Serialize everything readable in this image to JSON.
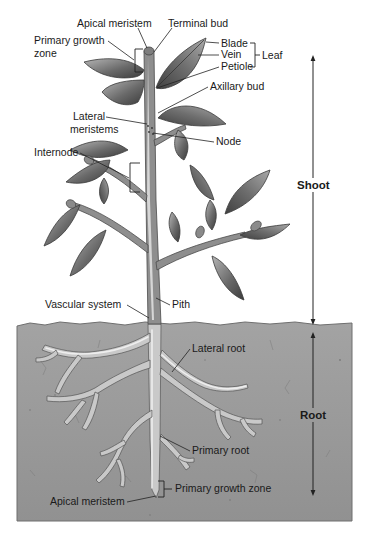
{
  "diagram": {
    "colors": {
      "background": "#ffffff",
      "soil": "#9a9a9a",
      "soil_edge": "#7a7a7a",
      "stem": "#8e8e8e",
      "leaf_dark": "#4f4f4f",
      "leaf_light": "#a8a8a8",
      "root": "#c9c9c9",
      "text": "#1a1a1a"
    },
    "labels": {
      "apical_meristem_top": "Apical meristem",
      "terminal_bud": "Terminal bud",
      "primary_growth_zone_top_line1": "Primary growth",
      "primary_growth_zone_top_line2": "zone",
      "blade": "Blade",
      "vein": "Vein",
      "petiole": "Petiole",
      "leaf": "Leaf",
      "axillary_bud": "Axillary bud",
      "lateral_meristems_line1": "Lateral",
      "lateral_meristems_line2": "meristems",
      "node": "Node",
      "internode": "Internode",
      "shoot": "Shoot",
      "vascular_system": "Vascular system",
      "pith": "Pith",
      "lateral_root": "Lateral root",
      "root": "Root",
      "primary_root": "Primary root",
      "primary_growth_zone_bottom": "Primary growth zone",
      "apical_meristem_bottom": "Apical meristem"
    },
    "regions": [
      {
        "name": "Shoot",
        "extent": "above soil line"
      },
      {
        "name": "Root",
        "extent": "below soil line"
      }
    ],
    "leaf_parts": [
      "Blade",
      "Vein",
      "Petiole"
    ]
  }
}
